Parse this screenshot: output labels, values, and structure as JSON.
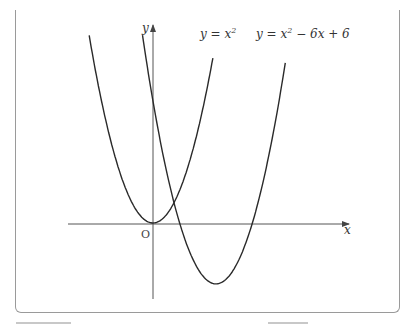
{
  "diagram": {
    "axes": {
      "x_label": "x",
      "y_label": "y",
      "origin_label": "O"
    },
    "curves": [
      {
        "name": "parabola-1",
        "equation": "y = x^2",
        "label_main": "y = x",
        "label_sup": "2"
      },
      {
        "name": "parabola-2",
        "equation": "y = x^2 - 6x + 6",
        "label_main1": "y = x",
        "label_sup": "2",
        "label_main2": " − 6x + 6"
      }
    ],
    "colors": {
      "curve": "#2a2a2a",
      "axis": "#555555",
      "frame": "#9a9a9a"
    }
  }
}
